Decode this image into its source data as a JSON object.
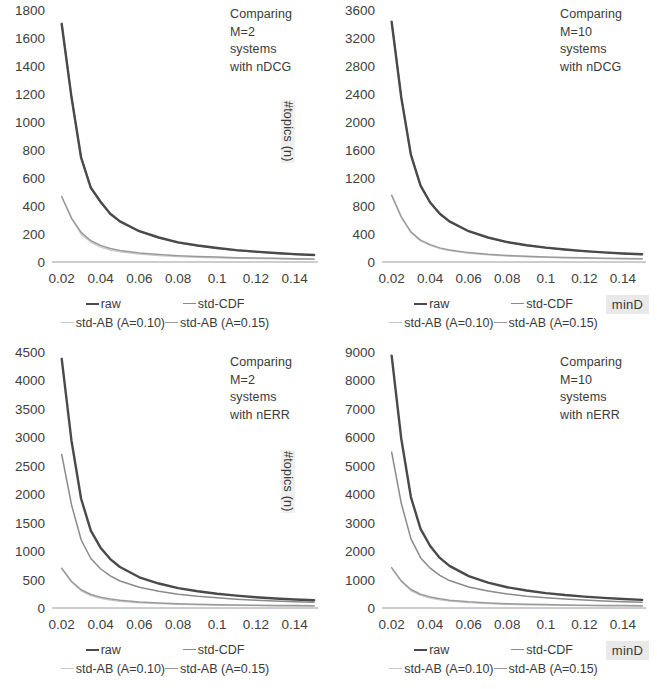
{
  "figure": {
    "panel_count": 4,
    "shared": {
      "xlabel": "",
      "ylabel": "#topics (n)",
      "minD_label": "minD",
      "xticks": [
        "0.02",
        "0.04",
        "0.06",
        "0.08",
        "0.1",
        "0.12",
        "0.14"
      ],
      "legend": [
        {
          "key": "raw",
          "label": "raw",
          "color": "#4a4a4a"
        },
        {
          "key": "std-CDF",
          "label": "std-CDF",
          "color": "#8a8a8a"
        },
        {
          "key": "std-AB-010",
          "label": "std-AB (A=0.10)",
          "color": "#c8c8c8"
        },
        {
          "key": "std-AB-015",
          "label": "std-AB (A=0.15)",
          "color": "#9a9a9a"
        }
      ]
    }
  },
  "chart_data": [
    {
      "id": "top-left",
      "type": "line",
      "title": "Comparing\nM=2\nsystems\nwith nDCG",
      "xlabel": "",
      "ylabel": "#topics (n)",
      "xlim": [
        0.015,
        0.152
      ],
      "ylim": [
        0,
        1800
      ],
      "yticks": [
        0,
        200,
        400,
        600,
        800,
        1000,
        1200,
        1400,
        1600,
        1800
      ],
      "xticks": [
        0.02,
        0.04,
        0.06,
        0.08,
        0.1,
        0.12,
        0.14
      ],
      "grid": false,
      "x": [
        0.02,
        0.025,
        0.03,
        0.035,
        0.04,
        0.045,
        0.05,
        0.06,
        0.07,
        0.08,
        0.09,
        0.1,
        0.11,
        0.12,
        0.13,
        0.14,
        0.15
      ],
      "series": [
        {
          "name": "raw",
          "values": [
            1700,
            1180,
            745,
            530,
            430,
            345,
            290,
            220,
            175,
            140,
            118,
            100,
            85,
            74,
            64,
            56,
            50
          ]
        },
        {
          "name": "std-CDF",
          "values": [
            1705,
            1185,
            748,
            532,
            428,
            343,
            288,
            218,
            173,
            138,
            116,
            98,
            83,
            72,
            62,
            54,
            48
          ]
        },
        {
          "name": "std-AB (A=0.10)",
          "values": [
            465,
            310,
            198,
            140,
            105,
            85,
            72,
            55,
            45,
            38,
            33,
            29,
            26,
            23,
            21,
            19,
            18
          ]
        },
        {
          "name": "std-AB (A=0.15)",
          "values": [
            468,
            315,
            212,
            152,
            118,
            96,
            82,
            64,
            53,
            45,
            39,
            35,
            31,
            28,
            26,
            24,
            22
          ]
        }
      ]
    },
    {
      "id": "top-right",
      "type": "line",
      "title": "Comparing\nM=10\nsystems\nwith nDCG",
      "xlabel": "",
      "ylabel": "",
      "xlim": [
        0.015,
        0.152
      ],
      "ylim": [
        0,
        3600
      ],
      "yticks": [
        0,
        400,
        800,
        1200,
        1600,
        2000,
        2400,
        2800,
        3200,
        3600
      ],
      "xticks": [
        0.02,
        0.04,
        0.06,
        0.08,
        0.1,
        0.12,
        0.14
      ],
      "grid": false,
      "x": [
        0.02,
        0.025,
        0.03,
        0.035,
        0.04,
        0.045,
        0.05,
        0.06,
        0.07,
        0.08,
        0.09,
        0.1,
        0.11,
        0.12,
        0.13,
        0.14,
        0.15
      ],
      "series": [
        {
          "name": "raw",
          "values": [
            3430,
            2350,
            1530,
            1090,
            850,
            690,
            580,
            440,
            350,
            285,
            240,
            205,
            178,
            155,
            137,
            122,
            110
          ]
        },
        {
          "name": "std-CDF",
          "values": [
            3440,
            2360,
            1535,
            1092,
            848,
            688,
            578,
            438,
            348,
            283,
            238,
            203,
            176,
            153,
            135,
            120,
            108
          ]
        },
        {
          "name": "std-AB (A=0.10)",
          "values": [
            950,
            640,
            420,
            300,
            235,
            190,
            160,
            122,
            100,
            84,
            72,
            64,
            57,
            51,
            46,
            42,
            39
          ]
        },
        {
          "name": "std-AB (A=0.15)",
          "values": [
            955,
            645,
            430,
            312,
            248,
            202,
            172,
            134,
            110,
            93,
            81,
            72,
            65,
            59,
            54,
            50,
            46
          ]
        }
      ]
    },
    {
      "id": "bottom-left",
      "type": "line",
      "title": "Comparing\nM=2\nsystems\nwith nERR",
      "xlabel": "",
      "ylabel": "#topics (n)",
      "xlim": [
        0.015,
        0.152
      ],
      "ylim": [
        0,
        4500
      ],
      "yticks": [
        0,
        500,
        1000,
        1500,
        2000,
        2500,
        3000,
        3500,
        4000,
        4500
      ],
      "xticks": [
        0.02,
        0.04,
        0.06,
        0.08,
        0.1,
        0.12,
        0.14
      ],
      "grid": false,
      "x": [
        0.02,
        0.025,
        0.03,
        0.035,
        0.04,
        0.045,
        0.05,
        0.06,
        0.07,
        0.08,
        0.09,
        0.1,
        0.11,
        0.12,
        0.13,
        0.14,
        0.15
      ],
      "series": [
        {
          "name": "raw",
          "values": [
            4380,
            2950,
            1920,
            1360,
            1060,
            860,
            720,
            540,
            430,
            350,
            295,
            250,
            218,
            190,
            168,
            150,
            135
          ]
        },
        {
          "name": "std-CDF",
          "values": [
            2700,
            1820,
            1200,
            870,
            690,
            565,
            475,
            365,
            295,
            243,
            205,
            178,
            155,
            137,
            122,
            110,
            100
          ]
        },
        {
          "name": "std-AB (A=0.10)",
          "values": [
            690,
            455,
            300,
            215,
            168,
            137,
            116,
            90,
            74,
            62,
            54,
            48,
            43,
            39,
            36,
            33,
            31
          ]
        },
        {
          "name": "std-AB (A=0.15)",
          "values": [
            700,
            470,
            320,
            238,
            190,
            158,
            135,
            106,
            88,
            75,
            66,
            59,
            53,
            49,
            45,
            42,
            39
          ]
        }
      ]
    },
    {
      "id": "bottom-right",
      "type": "line",
      "title": "Comparing\nM=10\nsystems\nwith nERR",
      "xlabel": "",
      "ylabel": "",
      "xlim": [
        0.015,
        0.152
      ],
      "ylim": [
        0,
        9000
      ],
      "yticks": [
        0,
        1000,
        2000,
        3000,
        4000,
        5000,
        6000,
        7000,
        8000,
        9000
      ],
      "xticks": [
        0.02,
        0.04,
        0.06,
        0.08,
        0.1,
        0.12,
        0.14
      ],
      "grid": false,
      "x": [
        0.02,
        0.025,
        0.03,
        0.035,
        0.04,
        0.045,
        0.05,
        0.06,
        0.07,
        0.08,
        0.09,
        0.1,
        0.11,
        0.12,
        0.13,
        0.14,
        0.15
      ],
      "series": [
        {
          "name": "raw",
          "values": [
            8870,
            5950,
            3900,
            2780,
            2180,
            1760,
            1480,
            1120,
            890,
            730,
            615,
            525,
            455,
            400,
            355,
            315,
            285
          ]
        },
        {
          "name": "std-CDF",
          "values": [
            5480,
            3680,
            2440,
            1770,
            1400,
            1145,
            965,
            740,
            595,
            492,
            417,
            358,
            313,
            277,
            247,
            222,
            200
          ]
        },
        {
          "name": "std-AB (A=0.10)",
          "values": [
            1400,
            925,
            610,
            440,
            345,
            282,
            238,
            185,
            152,
            128,
            111,
            98,
            88,
            80,
            73,
            68,
            63
          ]
        },
        {
          "name": "std-AB (A=0.15)",
          "values": [
            1420,
            955,
            650,
            483,
            387,
            322,
            275,
            216,
            180,
            153,
            134,
            120,
            109,
            100,
            92,
            86,
            80
          ]
        }
      ]
    }
  ]
}
